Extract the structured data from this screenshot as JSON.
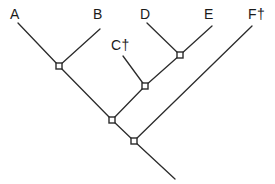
{
  "figure": {
    "type": "cladogram",
    "background_color": "#ffffff",
    "line_color": "#2b2b2b",
    "label_color": "#1a1a1a",
    "node_fill": "#ffffff",
    "width": 275,
    "height": 184
  },
  "labels": [
    {
      "id": "A",
      "text": "A",
      "x": 10,
      "y": 7,
      "extinct": false
    },
    {
      "id": "B",
      "text": "B",
      "x": 93,
      "y": 7,
      "extinct": false
    },
    {
      "id": "C",
      "text": "C†",
      "x": 111,
      "y": 38,
      "extinct": true
    },
    {
      "id": "D",
      "text": "D",
      "x": 140,
      "y": 7,
      "extinct": false
    },
    {
      "id": "E",
      "text": "E",
      "x": 204,
      "y": 7,
      "extinct": false
    },
    {
      "id": "F",
      "text": "F†",
      "x": 248,
      "y": 7,
      "extinct": true
    }
  ],
  "nodes": [
    {
      "id": "n1",
      "name": "node-ab",
      "x": 59,
      "y": 66
    },
    {
      "id": "n2",
      "name": "node-de",
      "x": 180,
      "y": 55
    },
    {
      "id": "n3",
      "name": "node-cde",
      "x": 145,
      "y": 86
    },
    {
      "id": "n4",
      "name": "node-abcde",
      "x": 112,
      "y": 120
    },
    {
      "id": "n5",
      "name": "node-root",
      "x": 134,
      "y": 141
    }
  ],
  "branches": [
    {
      "id": "br-a",
      "name": "branch-a",
      "x1": 18,
      "y1": 23,
      "x2": 59,
      "y2": 66
    },
    {
      "id": "br-b",
      "name": "branch-b",
      "x1": 100,
      "y1": 29,
      "x2": 59,
      "y2": 66
    },
    {
      "id": "br-c",
      "name": "branch-c",
      "x1": 123,
      "y1": 56,
      "x2": 145,
      "y2": 86
    },
    {
      "id": "br-d",
      "name": "branch-d",
      "x1": 147,
      "y1": 23,
      "x2": 180,
      "y2": 55
    },
    {
      "id": "br-e",
      "name": "branch-e",
      "x1": 212,
      "y1": 26,
      "x2": 180,
      "y2": 55
    },
    {
      "id": "br-de",
      "name": "branch-de",
      "x1": 180,
      "y1": 55,
      "x2": 145,
      "y2": 86
    },
    {
      "id": "br-cde",
      "name": "branch-cde",
      "x1": 145,
      "y1": 86,
      "x2": 112,
      "y2": 120
    },
    {
      "id": "br-ab",
      "name": "branch-ab",
      "x1": 59,
      "y1": 66,
      "x2": 112,
      "y2": 120
    },
    {
      "id": "br-int",
      "name": "branch-abcde",
      "x1": 112,
      "y1": 120,
      "x2": 134,
      "y2": 141
    },
    {
      "id": "br-f",
      "name": "branch-f",
      "x1": 252,
      "y1": 26,
      "x2": 134,
      "y2": 141
    },
    {
      "id": "br-root",
      "name": "branch-root",
      "x1": 134,
      "y1": 141,
      "x2": 175,
      "y2": 179
    }
  ],
  "node_marker": {
    "shape": "square",
    "size": 6,
    "stroke_width": 1.4
  },
  "stroke_width": 1.3
}
